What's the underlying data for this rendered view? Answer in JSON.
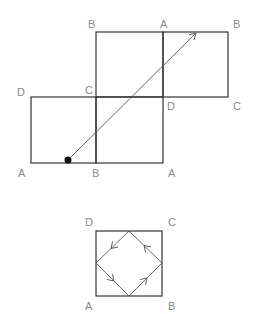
{
  "diagram": {
    "top": {
      "squares": [
        {
          "name": "left-square",
          "x": 31,
          "y": 97,
          "w": 65,
          "h": 66
        },
        {
          "name": "bottom-middle-square",
          "x": 96,
          "y": 97,
          "w": 67,
          "h": 66
        },
        {
          "name": "top-middle-square",
          "x": 96,
          "y": 32,
          "w": 67,
          "h": 65
        },
        {
          "name": "right-square",
          "x": 163,
          "y": 32,
          "w": 65,
          "h": 65
        }
      ],
      "labels": [
        {
          "text": "B",
          "x": 88,
          "y": 28
        },
        {
          "text": "A",
          "x": 160,
          "y": 28
        },
        {
          "text": "B",
          "x": 233,
          "y": 28
        },
        {
          "text": "D",
          "x": 17,
          "y": 96
        },
        {
          "text": "C",
          "x": 85,
          "y": 94
        },
        {
          "text": "D",
          "x": 167,
          "y": 110
        },
        {
          "text": "C",
          "x": 233,
          "y": 110
        },
        {
          "text": "A",
          "x": 18,
          "y": 177
        },
        {
          "text": "B",
          "x": 92,
          "y": 177
        },
        {
          "text": "A",
          "x": 168,
          "y": 177
        }
      ],
      "path": {
        "start": [
          68,
          160
        ],
        "end": [
          196,
          33
        ],
        "start_marker": "dot",
        "end_marker": "arrow"
      }
    },
    "bottom": {
      "square": {
        "x": 96,
        "y": 231,
        "w": 66,
        "h": 65
      },
      "labels": [
        {
          "text": "D",
          "x": 85,
          "y": 226
        },
        {
          "text": "C",
          "x": 168,
          "y": 226
        },
        {
          "text": "A",
          "x": 85,
          "y": 310
        },
        {
          "text": "B",
          "x": 168,
          "y": 310
        }
      ],
      "diamond": [
        [
          129,
          231
        ],
        [
          162,
          263
        ],
        [
          129,
          296
        ],
        [
          96,
          263
        ]
      ],
      "arrow_direction": "counterclockwise"
    }
  }
}
